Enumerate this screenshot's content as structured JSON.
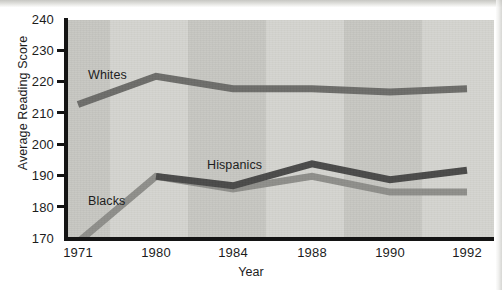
{
  "chart_data": {
    "type": "line",
    "title": "",
    "subtitle": "",
    "xlabel": "Year",
    "ylabel": "Average Reading Score",
    "categories": [
      "1971",
      "1980",
      "1984",
      "1988",
      "1990",
      "1992"
    ],
    "x": [
      1971,
      1980,
      1984,
      1988,
      1990,
      1992
    ],
    "ylim": [
      170,
      240
    ],
    "yticks": [
      170,
      180,
      190,
      200,
      210,
      220,
      230,
      240
    ],
    "ytick_labels": [
      "170",
      "180",
      "190",
      "200",
      "210",
      "220",
      "230",
      "240"
    ],
    "grid": false,
    "legend_position": "inline-annotation",
    "series": [
      {
        "name": "Whites",
        "color": "#6d6d6a",
        "values": [
          213,
          222,
          218,
          218,
          217,
          218
        ],
        "label_anchor": {
          "year": "1971",
          "value": 224
        }
      },
      {
        "name": "Hispanics",
        "color": "#4a4a49",
        "values": [
          null,
          190,
          187,
          194,
          189,
          192
        ],
        "label_anchor": {
          "year": "1984",
          "value": 199
        }
      },
      {
        "name": "Blacks",
        "color": "#8f8f8b",
        "values": [
          169,
          190,
          186,
          190,
          185,
          185
        ],
        "label_anchor": {
          "year": "1971",
          "value": 183
        }
      }
    ],
    "annotations": [
      {
        "text": "Whites",
        "series": "Whites"
      },
      {
        "text": "Hispanics",
        "series": "Hispanics"
      },
      {
        "text": "Blacks",
        "series": "Blacks"
      }
    ]
  },
  "axes": {
    "y_axis_title": "Average Reading Score",
    "x_axis_title": "Year",
    "y_tick_labels": [
      "240",
      "230",
      "220",
      "210",
      "200",
      "190",
      "180",
      "170"
    ],
    "x_tick_labels": [
      "1971",
      "1980",
      "1984",
      "1988",
      "1990",
      "1992"
    ]
  },
  "series_labels": {
    "whites": "Whites",
    "hispanics": "Hispanics",
    "blacks": "Blacks"
  },
  "colors": {
    "whites_line": "#6d6d6a",
    "hispanics_line": "#4a4a49",
    "blacks_line": "#8f8f8b",
    "axis": "#141414",
    "plot_band_dark": "#c7c7c2",
    "plot_band_light": "#d5d5d0",
    "page_background": "#ffffff"
  }
}
